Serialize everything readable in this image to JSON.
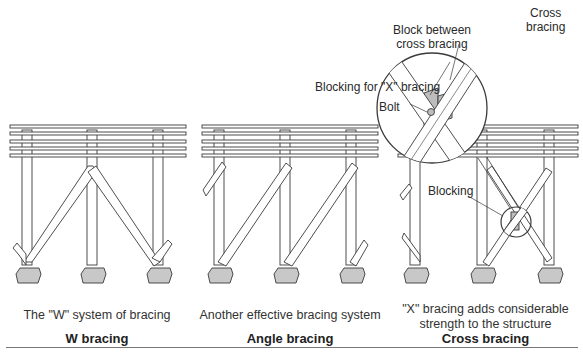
{
  "panels": [
    {
      "id": "w",
      "caption": "The \"W\" system of bracing",
      "title": "W bracing"
    },
    {
      "id": "angle",
      "caption": "Another effective bracing system",
      "title": "Angle bracing"
    },
    {
      "id": "cross",
      "caption_line1": "\"X\" bracing adds considerable",
      "caption_line2": "strength to the structure",
      "title": "Cross bracing"
    }
  ],
  "callouts": {
    "cross_bracing_line1": "Cross",
    "cross_bracing_line2": "bracing",
    "block_between_line1": "Block between",
    "block_between_line2": "cross bracing",
    "blocking_x": "Blocking for \"X\" bracing",
    "bolt": "Bolt",
    "blocking": "Blocking"
  },
  "colors": {
    "line": "#3a3a3a",
    "footing_fill": "#c8c8c8",
    "block_fill": "#bdbdbd",
    "wood_fill": "#ffffff"
  }
}
